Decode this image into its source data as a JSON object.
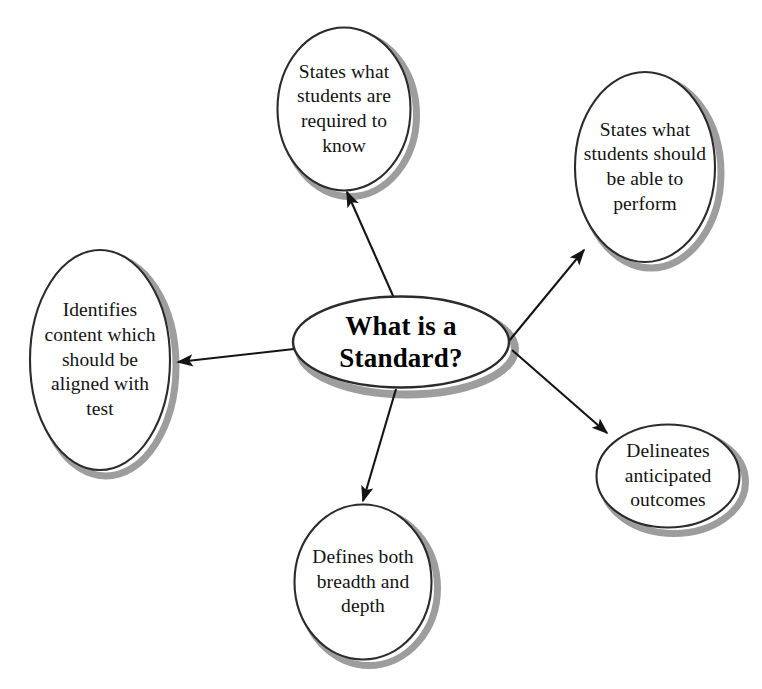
{
  "diagram": {
    "type": "concept-map",
    "title": "What is a Standard?",
    "background_color": "#ffffff",
    "outline_color": "#2b2b2b",
    "shadow_color": "#9a9a9a",
    "arrow_color": "#1a1a1a",
    "center": {
      "id": "center-node",
      "label": "What is a Standard?",
      "lines": [
        "What is a",
        "Standard?"
      ],
      "shape": "ellipse",
      "bold": true
    },
    "nodes": [
      {
        "id": "node-states-required-to-know",
        "label": "States what students are required to know",
        "lines": [
          "States what",
          "students",
          "are required",
          "to know"
        ],
        "shape": "ellipse",
        "position": "top"
      },
      {
        "id": "node-states-able-to-perform",
        "label": "States what students should be able to perform",
        "lines": [
          "States what",
          "students",
          "should be",
          "able to",
          "perform"
        ],
        "shape": "ellipse",
        "position": "top-right"
      },
      {
        "id": "node-delineates-outcomes",
        "label": "Delineates anticipated outcomes",
        "lines": [
          "Delineates",
          "anticipated",
          "outcomes"
        ],
        "shape": "ellipse",
        "position": "bottom-right"
      },
      {
        "id": "node-defines-breadth-depth",
        "label": "Defines both breadth and depth",
        "lines": [
          "Defines",
          "both",
          "breadth and",
          "depth"
        ],
        "shape": "ellipse",
        "position": "bottom"
      },
      {
        "id": "node-identifies-content-aligned",
        "label": "Identifies content which should be aligned with test",
        "lines": [
          "Identifies",
          "content",
          "which",
          "should be",
          "aligned",
          "with test"
        ],
        "shape": "ellipse",
        "position": "left"
      }
    ],
    "connectors": [
      {
        "id": "arrow-to-states-required-to-know",
        "from": "center-node",
        "to": "node-states-required-to-know",
        "style": "single-arrow"
      },
      {
        "id": "arrow-to-states-able-to-perform",
        "from": "center-node",
        "to": "node-states-able-to-perform",
        "style": "single-arrow"
      },
      {
        "id": "arrow-to-delineates-outcomes",
        "from": "center-node",
        "to": "node-delineates-outcomes",
        "style": "single-arrow"
      },
      {
        "id": "arrow-to-defines-breadth-depth",
        "from": "center-node",
        "to": "node-defines-breadth-depth",
        "style": "single-arrow"
      },
      {
        "id": "arrow-to-identifies-content-aligned",
        "from": "center-node",
        "to": "node-identifies-content-aligned",
        "style": "single-arrow"
      }
    ]
  }
}
